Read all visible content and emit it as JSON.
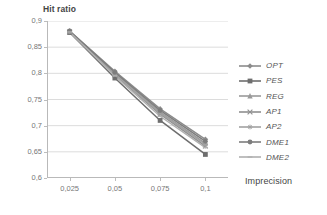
{
  "chart_data": {
    "type": "line",
    "title": "",
    "xlabel": "Imprecision",
    "ylabel": "Hit ratio",
    "x": [
      0.025,
      0.05,
      0.075,
      0.1
    ],
    "xtick_labels": [
      "0,025",
      "0,05",
      "0,075",
      "0,1"
    ],
    "ytick_labels": [
      "0,6",
      "0,65",
      "0,7",
      "0,75",
      "0,8",
      "0,85",
      "0,9"
    ],
    "ytick_values": [
      0.6,
      0.65,
      0.7,
      0.75,
      0.8,
      0.85,
      0.9
    ],
    "ylim": [
      0.6,
      0.9
    ],
    "xlim": [
      0.0125,
      0.1125
    ],
    "grid": "horizontal",
    "legend_position": "right",
    "series": [
      {
        "name": "OPT",
        "marker": "diamond",
        "color": "#8c8c8c",
        "values": [
          0.881,
          0.804,
          0.732,
          0.674
        ]
      },
      {
        "name": "PES",
        "marker": "square",
        "color": "#6e6e6e",
        "values": [
          0.878,
          0.791,
          0.71,
          0.645
        ]
      },
      {
        "name": "REG",
        "marker": "triangle",
        "color": "#9a9a9a",
        "values": [
          0.88,
          0.8,
          0.726,
          0.666
        ]
      },
      {
        "name": "AP1",
        "marker": "x",
        "color": "#8f8f8f",
        "values": [
          0.879,
          0.797,
          0.722,
          0.661
        ]
      },
      {
        "name": "AP2",
        "marker": "star",
        "color": "#a2a2a2",
        "values": [
          0.88,
          0.799,
          0.724,
          0.664
        ]
      },
      {
        "name": "DME1",
        "marker": "circle",
        "color": "#7d7d7d",
        "values": [
          0.881,
          0.802,
          0.729,
          0.67
        ]
      },
      {
        "name": "DME2",
        "marker": "line",
        "color": "#b0b0b0",
        "values": [
          0.879,
          0.795,
          0.718,
          0.658
        ]
      }
    ]
  },
  "axes": {
    "y_title": "Hit ratio",
    "x_title": "Imprecision"
  },
  "legend": {
    "items": [
      {
        "label": "OPT"
      },
      {
        "label": "PES"
      },
      {
        "label": "REG"
      },
      {
        "label": "AP1"
      },
      {
        "label": "AP2"
      },
      {
        "label": "DME1"
      },
      {
        "label": "DME2"
      }
    ]
  },
  "colors": {
    "gridline": "#dcdcdc",
    "axis": "#b9b9b9",
    "text": "#6f6f6f"
  }
}
